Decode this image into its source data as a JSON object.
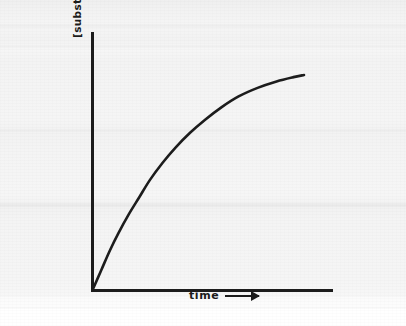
{
  "figure": {
    "background_color": "#f3f3f3",
    "ink_color": "#1c1c1c",
    "y_axis_label": "[substrate] utilized or [product] formed",
    "x_axis_label": "time",
    "y_axis_arrow_icon": "arrow-up-icon",
    "x_axis_arrow_icon": "arrow-right-icon"
  },
  "chart_data": {
    "type": "line",
    "title": "",
    "xlabel": "time",
    "ylabel": "[substrate] utilized or [product] formed",
    "grid": false,
    "legend": "none",
    "axis_ticks": "none",
    "xlim": [
      0,
      1
    ],
    "ylim": [
      0,
      1
    ],
    "annotations": [],
    "series": [
      {
        "name": "progress curve",
        "description": "saturating progress curve: steep linear initial rate that curves over and approaches a plateau",
        "x": [
          0.0,
          0.04,
          0.08,
          0.12,
          0.17,
          0.22,
          0.27,
          0.33,
          0.39,
          0.46,
          0.53,
          0.61,
          0.69,
          0.78,
          0.87,
          0.95,
          1.0
        ],
        "y": [
          0.0,
          0.09,
          0.18,
          0.26,
          0.35,
          0.43,
          0.51,
          0.59,
          0.66,
          0.73,
          0.79,
          0.85,
          0.9,
          0.94,
          0.97,
          0.99,
          1.0
        ]
      }
    ]
  }
}
